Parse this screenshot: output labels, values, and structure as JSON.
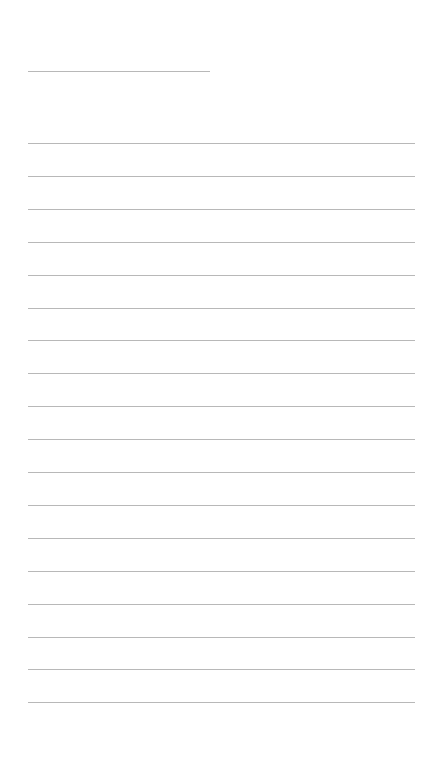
{
  "page": {
    "background_color": "#ffffff",
    "line_color": "#b8b8b8",
    "title": {
      "text": "",
      "line": {
        "x": 28,
        "y": 71,
        "width": 182
      }
    },
    "ruled_lines": {
      "count": 18,
      "x": 28,
      "width": 387,
      "first_y": 143,
      "spacing": 32.9,
      "lines": [
        {
          "index": 1,
          "text": ""
        },
        {
          "index": 2,
          "text": ""
        },
        {
          "index": 3,
          "text": ""
        },
        {
          "index": 4,
          "text": ""
        },
        {
          "index": 5,
          "text": ""
        },
        {
          "index": 6,
          "text": ""
        },
        {
          "index": 7,
          "text": ""
        },
        {
          "index": 8,
          "text": ""
        },
        {
          "index": 9,
          "text": ""
        },
        {
          "index": 10,
          "text": ""
        },
        {
          "index": 11,
          "text": ""
        },
        {
          "index": 12,
          "text": ""
        },
        {
          "index": 13,
          "text": ""
        },
        {
          "index": 14,
          "text": ""
        },
        {
          "index": 15,
          "text": ""
        },
        {
          "index": 16,
          "text": ""
        },
        {
          "index": 17,
          "text": ""
        },
        {
          "index": 18,
          "text": ""
        }
      ]
    }
  }
}
